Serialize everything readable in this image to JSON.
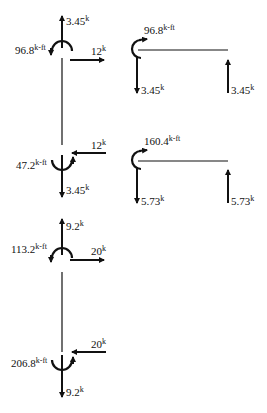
{
  "diagram": {
    "title": "",
    "column_top": {
      "top_joint": {
        "axial": {
          "value": "3.45",
          "unit": "k"
        },
        "moment": {
          "value": "96.8",
          "unit": "k-ft"
        },
        "shear": {
          "value": "12",
          "unit": "k"
        }
      },
      "bottom_joint": {
        "shear": {
          "value": "12",
          "unit": "k"
        },
        "moment": {
          "value": "47.2",
          "unit": "k-ft"
        },
        "axial": {
          "value": "3.45",
          "unit": "k"
        }
      }
    },
    "column_bottom": {
      "top_joint": {
        "axial": {
          "value": "9.2",
          "unit": "k"
        },
        "moment": {
          "value": "113.2",
          "unit": "k-ft"
        },
        "shear": {
          "value": "20",
          "unit": "k"
        }
      },
      "bottom_joint": {
        "shear": {
          "value": "20",
          "unit": "k"
        },
        "moment": {
          "value": "206.8",
          "unit": "k-ft"
        },
        "axial": {
          "value": "9.2",
          "unit": "k"
        }
      }
    },
    "beam_top": {
      "moment": {
        "value": "96.8",
        "unit": "k-ft"
      },
      "left_reaction": {
        "value": "3.45",
        "unit": "k"
      },
      "right_reaction": {
        "value": "3.45",
        "unit": "k"
      }
    },
    "beam_bottom": {
      "moment": {
        "value": "160.4",
        "unit": "k-ft"
      },
      "left_reaction": {
        "value": "5.73",
        "unit": "k"
      },
      "right_reaction": {
        "value": "5.73",
        "unit": "k"
      }
    }
  }
}
